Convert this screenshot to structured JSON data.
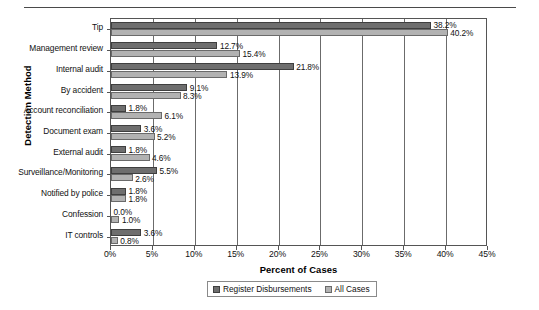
{
  "chart_data": {
    "type": "bar",
    "orientation": "horizontal",
    "title": "",
    "xlabel": "Percent of Cases",
    "ylabel": "Detection Method",
    "xlim": [
      0,
      45
    ],
    "xtick_labels": [
      "0%",
      "5%",
      "10%",
      "15%",
      "20%",
      "25%",
      "30%",
      "35%",
      "40%",
      "45%"
    ],
    "xticks": [
      0,
      5,
      10,
      15,
      20,
      25,
      30,
      35,
      40,
      45
    ],
    "grid": "vertical",
    "legend_position": "bottom",
    "categories": [
      "Tip",
      "Management review",
      "Internal audit",
      "By accident",
      "Account reconciliation",
      "Document exam",
      "External audit",
      "Surveillance/Monitoring",
      "Notified by police",
      "Confession",
      "IT controls"
    ],
    "series": [
      {
        "name": "Register Disbursements",
        "color": "#6e6e6e",
        "values": [
          38.2,
          12.7,
          21.8,
          9.1,
          1.8,
          3.6,
          1.8,
          5.5,
          1.8,
          0.0,
          3.6
        ],
        "labels": [
          "38.2%",
          "12.7%",
          "21.8%",
          "9.1%",
          "1.8%",
          "3.6%",
          "1.8%",
          "5.5%",
          "1.8%",
          "0.0%",
          "3.6%"
        ]
      },
      {
        "name": "All Cases",
        "color": "#b2b2b2",
        "values": [
          40.2,
          15.4,
          13.9,
          8.3,
          6.1,
          5.2,
          4.6,
          2.6,
          1.8,
          1.0,
          0.8
        ],
        "labels": [
          "40.2%",
          "15.4%",
          "13.9%",
          "8.3%",
          "6.1%",
          "5.2%",
          "4.6%",
          "2.6%",
          "1.8%",
          "1.0%",
          "0.8%"
        ]
      }
    ]
  }
}
